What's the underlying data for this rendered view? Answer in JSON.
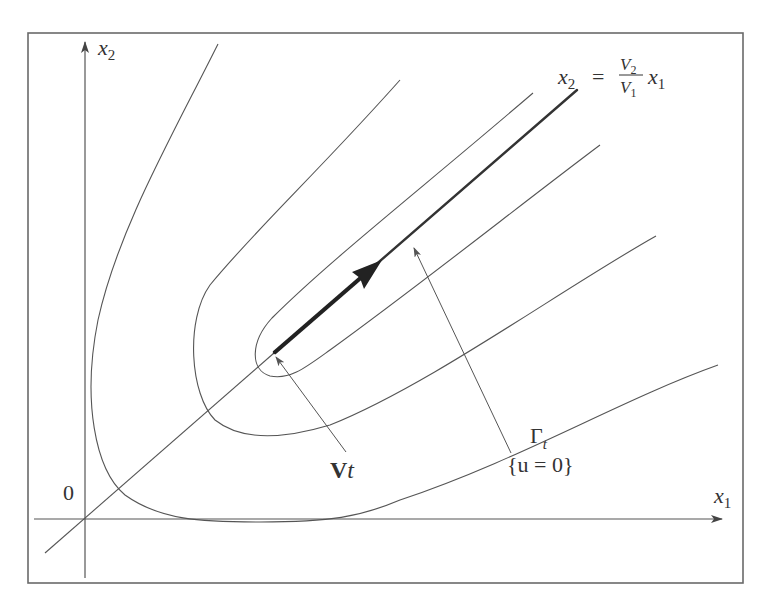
{
  "diagram": {
    "axes": {
      "x_label": "x",
      "x_label_sub": "1",
      "y_label": "x",
      "y_label_sub": "2",
      "origin_label": "0"
    },
    "line_equation": {
      "lhs": "x",
      "lhs_sub": "2",
      "equals": "=",
      "numerator": "V",
      "numerator_sub": "2",
      "denominator": "V",
      "denominator_sub": "1",
      "rhs": "x",
      "rhs_sub": "1"
    },
    "vector_label": {
      "bold": "V",
      "italic": "t"
    },
    "gamma_label": {
      "symbol": "Γ",
      "sub": "t",
      "set": "{u = 0}"
    },
    "elements": [
      "bounding frame",
      "x1 axis with arrow",
      "x2 axis with arrow",
      "thin line through origin with slope V2/V1",
      "thick ray from Vt along the line",
      "bold arrow representing velocity vector",
      "four nested parabola-like level curves opening toward upper-right",
      "pointer from label Vt to ray start",
      "pointer from label Γt to thick ray"
    ]
  }
}
